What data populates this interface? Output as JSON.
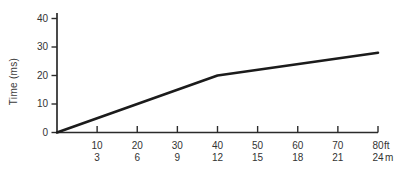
{
  "chart_data": {
    "type": "line",
    "title": "",
    "xlabel": "",
    "ylabel": "Time (ms)",
    "x_axis": {
      "primary_unit": "ft",
      "secondary_unit": "m",
      "ticks_ft": [
        10,
        20,
        30,
        40,
        50,
        60,
        70,
        80
      ],
      "ticks_m": [
        3,
        6,
        9,
        12,
        15,
        18,
        21,
        24
      ],
      "xlim_ft": [
        0,
        80
      ]
    },
    "y_axis": {
      "ticks": [
        0,
        10,
        20,
        30,
        40
      ],
      "ylim": [
        0,
        42
      ],
      "origin_label": "0"
    },
    "series": [
      {
        "name": "time-vs-distance",
        "x_ft": [
          0,
          40,
          80
        ],
        "y_ms": [
          0,
          20,
          28
        ]
      }
    ],
    "grid": false,
    "legend": false,
    "line_color": "#1b1b1b",
    "axis_color": "#2b2b2b",
    "background": "#ffffff"
  }
}
